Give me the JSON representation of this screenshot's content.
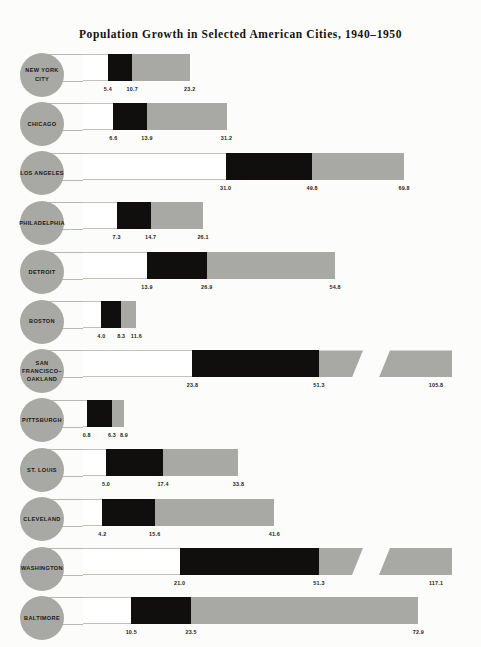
{
  "title": "Population Growth in Selected American Cities, 1940–1950",
  "chart_data": {
    "type": "bar",
    "title": "Population Growth in Selected American Cities, 1940–1950",
    "subtitle": "",
    "xlabel": "",
    "ylabel": "",
    "orientation": "horizontal",
    "grid": false,
    "legend": null,
    "note": "Each city row shows three marked values along a horizontal scale. The black segment spans from the first value to the second value; the grey segment continues from the second value to the third. Two rows use a broken (truncated) scale, shown by a diagonal slash.",
    "value_labels": [
      "value_1",
      "value_2",
      "value_3"
    ],
    "xlim": [
      0,
      120
    ],
    "categories": [
      "NEW YORK CITY",
      "CHICAGO",
      "LOS ANGELES",
      "PHILADELPHIA",
      "DETROIT",
      "BOSTON",
      "SAN FRANCISCO–OAKLAND",
      "PITTSBURGH",
      "ST. LOUIS",
      "CLEVELAND",
      "WASHINGTON",
      "BALTIMORE"
    ],
    "series": [
      {
        "name": "value_1",
        "values": [
          5.4,
          6.6,
          31.0,
          7.3,
          13.9,
          4.0,
          23.8,
          0.8,
          5.0,
          4.2,
          21.0,
          10.5
        ]
      },
      {
        "name": "value_2",
        "values": [
          10.7,
          13.9,
          49.8,
          14.7,
          26.9,
          8.3,
          51.3,
          6.3,
          17.4,
          15.6,
          51.3,
          23.5
        ]
      },
      {
        "name": "value_3",
        "values": [
          23.2,
          31.2,
          69.8,
          26.1,
          54.8,
          11.6,
          105.8,
          8.9,
          33.8,
          41.6,
          117.1,
          72.9
        ]
      }
    ]
  },
  "rows": [
    {
      "city": "NEW YORK CITY",
      "city_lines": "NEW YORK CITY",
      "values": [
        "5.4",
        "10.7",
        "23.2"
      ],
      "broken": false
    },
    {
      "city": "CHICAGO",
      "city_lines": "CHICAGO",
      "values": [
        "6.6",
        "13.9",
        "31.2"
      ],
      "broken": false
    },
    {
      "city": "LOS ANGELES",
      "city_lines": "LOS ANGELES",
      "values": [
        "31.0",
        "49.8",
        "69.8"
      ],
      "broken": false
    },
    {
      "city": "PHILADELPHIA",
      "city_lines": "PHILADELPHIA",
      "values": [
        "7.3",
        "14.7",
        "26.1"
      ],
      "broken": false
    },
    {
      "city": "DETROIT",
      "city_lines": "DETROIT",
      "values": [
        "13.9",
        "26.9",
        "54.8"
      ],
      "broken": false
    },
    {
      "city": "BOSTON",
      "city_lines": "BOSTON",
      "values": [
        "4.0",
        "8.3",
        "11.6"
      ],
      "broken": false
    },
    {
      "city": "SAN FRANCISCO-OAKLAND",
      "city_lines": "SAN FRANCISCO–\nOAKLAND",
      "values": [
        "23.8",
        "51.3",
        "105.8"
      ],
      "broken": true
    },
    {
      "city": "PITTSBURGH",
      "city_lines": "PITTSBURGH",
      "values": [
        "0.8",
        "6.3",
        "8.9"
      ],
      "broken": false
    },
    {
      "city": "ST. LOUIS",
      "city_lines": "ST. LOUIS",
      "values": [
        "5.0",
        "17.4",
        "33.8"
      ],
      "broken": false
    },
    {
      "city": "CLEVELAND",
      "city_lines": "CLEVELAND",
      "values": [
        "4.2",
        "15.6",
        "41.6"
      ],
      "broken": false
    },
    {
      "city": "WASHINGTON",
      "city_lines": "WASHINGTON",
      "values": [
        "21.0",
        "51.3",
        "117.1"
      ],
      "broken": true
    },
    {
      "city": "BALTIMORE",
      "city_lines": "BALTIMORE",
      "values": [
        "10.5",
        "23.5",
        "72.9"
      ],
      "broken": false
    }
  ],
  "colors": {
    "bar_grey": "#a8a8a4",
    "bar_black": "#100f0d",
    "bar_white": "#ffffff",
    "page": "#fcfcfa",
    "text": "#14120f"
  }
}
